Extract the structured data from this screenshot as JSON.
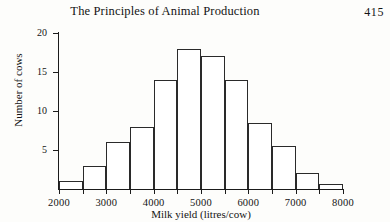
{
  "header": {
    "book_title": "The Principles of Animal Production",
    "page_number": "415"
  },
  "chart_data": {
    "type": "bar",
    "title": "",
    "xlabel": "Milk yield (litres/cow)",
    "ylabel": "Number of cows",
    "xlim": [
      2000,
      8000
    ],
    "ylim": [
      0,
      20
    ],
    "grid": false,
    "legend": null,
    "bin_width": 500,
    "x_ticks": [
      2000,
      3000,
      4000,
      5000,
      6000,
      7000,
      8000
    ],
    "x_tick_labels": [
      "2000",
      "3000",
      "4000",
      "5000",
      "6000",
      "7000",
      "8000"
    ],
    "y_ticks": [
      0,
      5,
      10,
      15,
      20
    ],
    "y_tick_labels": [
      "5",
      "10",
      "15",
      "20"
    ],
    "bins": [
      {
        "start": 2000,
        "end": 2500,
        "value": 1
      },
      {
        "start": 2500,
        "end": 3000,
        "value": 3
      },
      {
        "start": 3000,
        "end": 3500,
        "value": 6
      },
      {
        "start": 3500,
        "end": 4000,
        "value": 8
      },
      {
        "start": 4000,
        "end": 4500,
        "value": 14
      },
      {
        "start": 4500,
        "end": 5000,
        "value": 18
      },
      {
        "start": 5000,
        "end": 5500,
        "value": 17
      },
      {
        "start": 5500,
        "end": 6000,
        "value": 14
      },
      {
        "start": 6000,
        "end": 6500,
        "value": 8.5
      },
      {
        "start": 6500,
        "end": 7000,
        "value": 5.5
      },
      {
        "start": 7000,
        "end": 7500,
        "value": 2
      },
      {
        "start": 7500,
        "end": 8000,
        "value": 0.7
      }
    ],
    "categories": [
      "2000-2500",
      "2500-3000",
      "3000-3500",
      "3500-4000",
      "4000-4500",
      "4500-5000",
      "5000-5500",
      "5500-6000",
      "6000-6500",
      "6500-7000",
      "7000-7500",
      "7500-8000"
    ],
    "values": [
      1,
      3,
      6,
      8,
      14,
      18,
      17,
      14,
      8.5,
      5.5,
      2,
      0.7
    ]
  },
  "colors": {
    "ink": "#1b1b1b",
    "paper": "#fdfdfb",
    "bar_fill": "#ffffff",
    "bar_stroke": "#2a2a2a"
  }
}
